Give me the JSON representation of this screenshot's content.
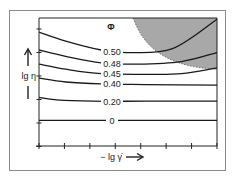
{
  "chart_data": {
    "type": "line",
    "title": "",
    "xlabel": "− lg γ̇",
    "ylabel": "lg η",
    "legend_title": "Φ",
    "x_ticks": 8,
    "y_ticks": 6,
    "grid": false,
    "shaded_region": {
      "description": "shear-thickening / jammed region (upper right)",
      "color": "#a8a8a8"
    },
    "series": [
      {
        "name": "0",
        "label": "0",
        "points": [
          [
            0,
            0.2
          ],
          [
            0.3,
            0.2
          ],
          [
            0.6,
            0.2
          ],
          [
            1,
            0.2
          ]
        ]
      },
      {
        "name": "0.20",
        "label": "0.20",
        "points": [
          [
            0,
            0.38
          ],
          [
            0.1,
            0.36
          ],
          [
            0.3,
            0.35
          ],
          [
            0.6,
            0.35
          ],
          [
            1,
            0.35
          ]
        ]
      },
      {
        "name": "0.40",
        "label": "0.40",
        "points": [
          [
            0,
            0.53
          ],
          [
            0.15,
            0.5
          ],
          [
            0.35,
            0.485
          ],
          [
            0.6,
            0.48
          ],
          [
            1,
            0.475
          ]
        ]
      },
      {
        "name": "0.45",
        "label": "0.45",
        "points": [
          [
            0,
            0.64
          ],
          [
            0.15,
            0.6
          ],
          [
            0.35,
            0.565
          ],
          [
            0.6,
            0.56
          ],
          [
            0.8,
            0.565
          ],
          [
            1,
            0.61
          ]
        ]
      },
      {
        "name": "0.48",
        "label": "0.48",
        "points": [
          [
            0,
            0.75
          ],
          [
            0.15,
            0.7
          ],
          [
            0.35,
            0.65
          ],
          [
            0.55,
            0.64
          ],
          [
            0.8,
            0.66
          ],
          [
            1,
            0.73
          ]
        ]
      },
      {
        "name": "0.50",
        "label": "0.50",
        "points": [
          [
            0,
            0.89
          ],
          [
            0.15,
            0.82
          ],
          [
            0.35,
            0.75
          ],
          [
            0.5,
            0.73
          ],
          [
            0.75,
            0.76
          ],
          [
            1,
            0.99
          ]
        ]
      }
    ]
  }
}
